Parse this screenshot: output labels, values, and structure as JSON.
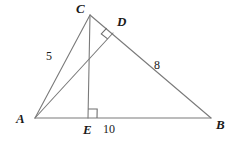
{
  "figure": {
    "background_color": "#ffffff",
    "stroke_color": "#7a7a7a",
    "label_color": "#1a1a1a"
  },
  "vertices": [
    {
      "id": "A",
      "label": "A",
      "x": 35,
      "y": 118,
      "label_x": 16,
      "label_y": 112
    },
    {
      "id": "B",
      "label": "B",
      "x": 211,
      "y": 118,
      "label_x": 216,
      "label_y": 118
    },
    {
      "id": "C",
      "label": "C",
      "x": 90,
      "y": 15,
      "label_x": 76,
      "label_y": 2
    },
    {
      "id": "D",
      "label": "D",
      "x": 113,
      "y": 33,
      "label_x": 117,
      "label_y": 15
    },
    {
      "id": "E",
      "label": "E",
      "x": 88,
      "y": 118,
      "label_x": 83,
      "label_y": 123
    }
  ],
  "segments": [
    {
      "name": "side-AB",
      "from": "A",
      "to": "B"
    },
    {
      "name": "side-AC",
      "from": "A",
      "to": "C"
    },
    {
      "name": "side-CB",
      "from": "C",
      "to": "B"
    },
    {
      "name": "altitude-CE",
      "from": "C",
      "to": "E"
    },
    {
      "name": "altitude-AD",
      "from": "A",
      "to": "D"
    }
  ],
  "side_labels": [
    {
      "name": "length-AC",
      "text": "5",
      "x": 46,
      "y": 50,
      "for_segment": "side-AC"
    },
    {
      "name": "length-DB",
      "text": "8",
      "x": 154,
      "y": 59,
      "for_segment": "side-CB"
    },
    {
      "name": "length-EB",
      "text": "10",
      "x": 103,
      "y": 123,
      "for_segment": "side-AB"
    }
  ],
  "right_angles": [
    {
      "name": "right-angle-at-E",
      "vertex": "E",
      "size": 9,
      "note": "CE perpendicular to AB"
    },
    {
      "name": "right-angle-at-D",
      "vertex": "D",
      "size": 8,
      "note": "AD perpendicular to CB"
    }
  ]
}
